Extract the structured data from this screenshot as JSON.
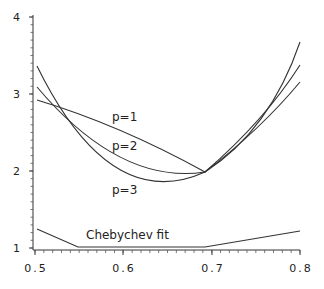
{
  "chart_data": {
    "type": "line",
    "title": "",
    "xlabel": "",
    "ylabel": "",
    "xlim": [
      0.5,
      0.8
    ],
    "ylim": [
      1,
      4
    ],
    "x_ticks": [
      "0.5",
      "0.6",
      "0.7",
      "0.8"
    ],
    "y_ticks": [
      "1",
      "2",
      "3",
      "4"
    ],
    "grid": false,
    "legend": "inline labels",
    "series": [
      {
        "name": "p=1",
        "x": [
          0.5,
          0.55,
          0.6,
          0.65,
          0.69,
          0.75,
          0.8
        ],
        "y": [
          2.93,
          2.78,
          2.55,
          2.25,
          2.0,
          2.55,
          3.17
        ]
      },
      {
        "name": "p=2",
        "x": [
          0.5,
          0.55,
          0.6,
          0.65,
          0.69,
          0.75,
          0.8
        ],
        "y": [
          3.1,
          2.65,
          2.2,
          1.97,
          2.0,
          2.6,
          3.4
        ]
      },
      {
        "name": "p=3",
        "x": [
          0.5,
          0.55,
          0.6,
          0.64,
          0.69,
          0.75,
          0.8
        ],
        "y": [
          3.4,
          2.6,
          2.0,
          1.8,
          1.98,
          2.55,
          3.7
        ]
      },
      {
        "name": "Chebychev fit",
        "x": [
          0.5,
          0.55,
          0.69,
          0.8
        ],
        "y": [
          1.25,
          1.0,
          1.0,
          1.22
        ]
      }
    ]
  },
  "labels": {
    "p1": "p=1",
    "p2": "p=2",
    "p3": "p=3",
    "cheb": "Chebychev fit"
  },
  "ticks": {
    "x": [
      "0.5",
      "0.6",
      "0.7",
      "0.8"
    ],
    "y": [
      "1",
      "2",
      "3",
      "4"
    ]
  }
}
